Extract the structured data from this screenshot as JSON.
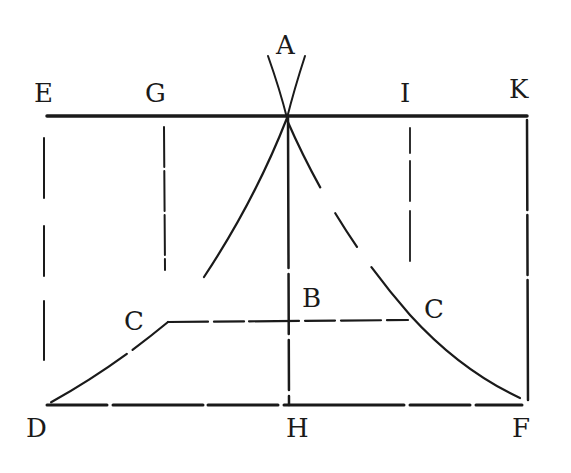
{
  "diagram": {
    "type": "geometric-construction",
    "labels": {
      "A": "A",
      "E": "E",
      "G": "G",
      "I": "I",
      "K": "K",
      "B": "B",
      "C_left": "C",
      "C_right": "C",
      "D": "D",
      "H": "H",
      "F": "F"
    },
    "colors": {
      "ink": "#1a1a1a",
      "background": "#ffffff"
    }
  }
}
